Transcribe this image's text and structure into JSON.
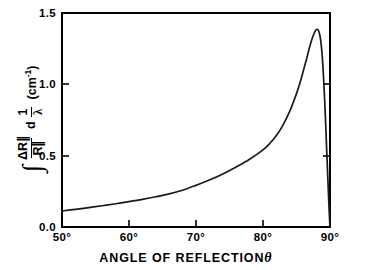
{
  "figure": {
    "background_color": "#ffffff",
    "line_color": "#1a1a1a",
    "axis_color": "#000000"
  },
  "axes": {
    "x_title_text": "ANGLE OF REFLECTION",
    "x_title_symbol": "θ",
    "x_ticks": [
      "50°",
      "60°",
      "70°",
      "80°",
      "90°"
    ],
    "y_ticks": [
      "0.0",
      "0.5",
      "1.0",
      "1.5"
    ],
    "y_title_integral": "∫",
    "y_title_numerator": "ΔR∥",
    "y_title_denominator": "R∥",
    "y_title_d": "d",
    "y_title_frac_num": "1",
    "y_title_frac_den": "λ",
    "y_title_units": "(cm",
    "y_title_units_exp": "-1",
    "y_title_units_close": ")"
  },
  "chart_data": {
    "type": "line",
    "title": "",
    "xlabel": "ANGLE OF REFLECTION θ",
    "ylabel": "∫ (ΔR∥/R∥) d(1/λ)  (cm⁻¹)",
    "xlim": [
      50,
      90
    ],
    "ylim": [
      0.0,
      1.5
    ],
    "xticks": [
      50,
      60,
      70,
      80,
      90
    ],
    "yticks": [
      0.0,
      0.5,
      1.0,
      1.5
    ],
    "grid": false,
    "legend": false,
    "series": [
      {
        "name": "integrated reflectance change",
        "x": [
          50.0,
          52.0,
          54.0,
          56.0,
          58.0,
          60.0,
          62.0,
          64.0,
          66.0,
          68.0,
          70.0,
          72.0,
          74.0,
          76.0,
          78.0,
          80.0,
          81.0,
          82.0,
          83.0,
          84.0,
          85.0,
          85.5,
          86.0,
          86.5,
          87.0,
          87.4,
          87.8,
          88.0,
          88.2,
          88.4,
          88.6,
          88.8,
          89.0,
          89.2,
          89.4,
          89.6,
          89.8,
          89.9,
          90.0
        ],
        "y": [
          0.112,
          0.124,
          0.136,
          0.149,
          0.163,
          0.178,
          0.194,
          0.212,
          0.232,
          0.258,
          0.292,
          0.329,
          0.372,
          0.421,
          0.475,
          0.541,
          0.585,
          0.641,
          0.716,
          0.812,
          0.935,
          1.008,
          1.091,
          1.178,
          1.268,
          1.33,
          1.375,
          1.385,
          1.383,
          1.362,
          1.312,
          1.222,
          1.082,
          0.892,
          0.668,
          0.432,
          0.196,
          0.086,
          0.0
        ]
      }
    ]
  }
}
